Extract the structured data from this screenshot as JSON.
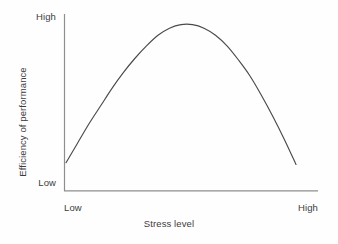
{
  "chart_data": {
    "type": "line",
    "title": "",
    "subtitle": "",
    "xlabel": "Stress level",
    "ylabel": "Efficiency of performance",
    "x_tick_labels": [
      "Low",
      "High"
    ],
    "y_tick_labels": [
      "Low",
      "High"
    ],
    "xlim": [
      0,
      1
    ],
    "ylim": [
      0,
      1
    ],
    "grid": false,
    "legend": false,
    "legend_position": "none",
    "annotations": [],
    "series": [
      {
        "name": "Efficiency of performance vs stress level",
        "shape": "inverted-u",
        "x": [
          0.0,
          0.05,
          0.1,
          0.15,
          0.2,
          0.25,
          0.3,
          0.35,
          0.4,
          0.45,
          0.5,
          0.55,
          0.6,
          0.65,
          0.7,
          0.75,
          0.8,
          0.85,
          0.9,
          0.95,
          1.0
        ],
        "values": [
          0.16,
          0.27,
          0.38,
          0.48,
          0.58,
          0.67,
          0.75,
          0.82,
          0.88,
          0.92,
          0.94,
          0.94,
          0.92,
          0.88,
          0.82,
          0.74,
          0.65,
          0.54,
          0.42,
          0.29,
          0.15
        ]
      }
    ],
    "peak": {
      "x": 0.5,
      "y": 0.94
    },
    "colors": {
      "curve": "#4a4a4a",
      "axis": "#8e8e8e",
      "text": "#3c3c3c",
      "background": "#fefefe"
    }
  },
  "axes": {
    "y_high_label": "High",
    "y_low_label": "Low",
    "x_low_label": "Low",
    "x_high_label": "High",
    "x_title": "Stress level",
    "y_title": "Efficiency of performance"
  }
}
